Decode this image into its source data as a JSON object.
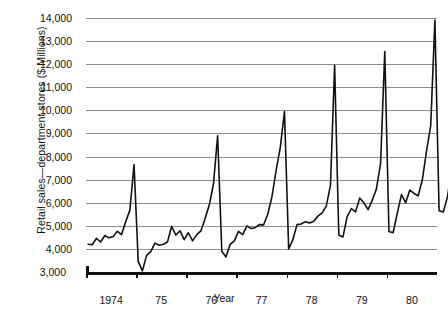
{
  "chart_data": {
    "type": "line",
    "title": "",
    "xlabel": "Year",
    "ylabel": "Retail sales—department stores ($ Millions)",
    "ylim": [
      3000,
      14000
    ],
    "ytick_labels": [
      "3,000",
      "4,000",
      "5,000",
      "6,000",
      "7,000",
      "8,000",
      "9,000",
      "10,000",
      "11,000",
      "12,000",
      "13,000",
      "14,000"
    ],
    "ytick_values": [
      3000,
      4000,
      5000,
      6000,
      7000,
      8000,
      9000,
      10000,
      11000,
      12000,
      13000,
      14000
    ],
    "xtick_labels": [
      "1974",
      "75",
      "76",
      "77",
      "78",
      "79",
      "80"
    ],
    "xlim": [
      1974.0,
      1981.0
    ],
    "grid": "horizontal",
    "legend": "none",
    "series_name": "Retail sales - department stores",
    "x_unit": "month",
    "x_start": "1974-01",
    "values": [
      4200,
      4180,
      4460,
      4300,
      4580,
      4480,
      4540,
      4760,
      4620,
      5180,
      5680,
      7650,
      3450,
      3050,
      3720,
      3880,
      4250,
      4160,
      4200,
      4300,
      4980,
      4600,
      4780,
      4400,
      4700,
      4350,
      4620,
      4780,
      5320,
      5900,
      6800,
      8900,
      3900,
      3650,
      4200,
      4350,
      4760,
      4620,
      5000,
      4880,
      4920,
      5050,
      5040,
      5500,
      6260,
      7400,
      8400,
      9950,
      4000,
      4400,
      5050,
      5080,
      5180,
      5120,
      5200,
      5420,
      5560,
      5850,
      6750,
      11950,
      4600,
      4520,
      5400,
      5750,
      5600,
      6200,
      6000,
      5700,
      6100,
      6600,
      7700,
      12550,
      4750,
      4700,
      5550,
      6350,
      6000,
      6550,
      6400,
      6300,
      7000,
      8250,
      9350,
      13900,
      5650,
      5600,
      6250,
      7400,
      7100,
      7750,
      7300
    ]
  }
}
